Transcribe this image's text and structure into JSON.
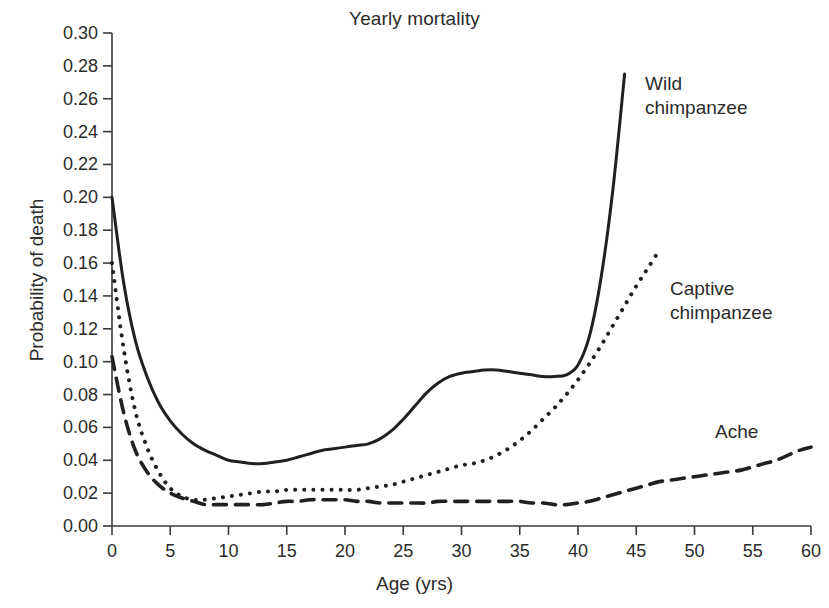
{
  "chart_data": {
    "type": "line",
    "title": "Yearly mortality",
    "xlabel": "Age (yrs)",
    "ylabel": "Probability of death",
    "xlim": [
      0,
      60
    ],
    "ylim": [
      0.0,
      0.3
    ],
    "grid": false,
    "legend_position": "inline-annotations",
    "xticks": [
      0,
      5,
      10,
      15,
      20,
      25,
      30,
      35,
      40,
      45,
      50,
      55,
      60
    ],
    "xtick_labels": [
      "0",
      "5",
      "10",
      "15",
      "20",
      "25",
      "30",
      "35",
      "40",
      "45",
      "50",
      "55",
      "60"
    ],
    "yticks": [
      0.0,
      0.02,
      0.04,
      0.06,
      0.08,
      0.1,
      0.12,
      0.14,
      0.16,
      0.18,
      0.2,
      0.22,
      0.24,
      0.26,
      0.28,
      0.3
    ],
    "ytick_labels": [
      "0.00",
      "0.02",
      "0.04",
      "0.06",
      "0.08",
      "0.10",
      "0.12",
      "0.14",
      "0.16",
      "0.18",
      "0.20",
      "0.22",
      "0.24",
      "0.26",
      "0.28",
      "0.30"
    ],
    "series": [
      {
        "name": "Wild chimpanzee",
        "style": "solid",
        "color": "#231f20",
        "x": [
          0,
          1,
          2,
          3,
          4,
          5,
          6,
          7,
          8,
          9,
          10,
          11,
          12,
          13,
          14,
          15,
          16,
          17,
          18,
          19,
          20,
          21,
          22,
          23,
          24,
          25,
          26,
          27,
          28,
          29,
          30,
          31,
          32,
          33,
          34,
          35,
          36,
          37,
          38,
          39,
          40,
          41,
          42,
          43,
          44
        ],
        "y": [
          0.2,
          0.148,
          0.113,
          0.091,
          0.075,
          0.064,
          0.056,
          0.05,
          0.046,
          0.043,
          0.04,
          0.039,
          0.038,
          0.038,
          0.039,
          0.04,
          0.042,
          0.044,
          0.046,
          0.047,
          0.048,
          0.049,
          0.05,
          0.053,
          0.058,
          0.065,
          0.073,
          0.081,
          0.087,
          0.091,
          0.093,
          0.094,
          0.095,
          0.095,
          0.094,
          0.093,
          0.092,
          0.091,
          0.091,
          0.092,
          0.098,
          0.116,
          0.152,
          0.205,
          0.275
        ]
      },
      {
        "name": "Captive chimpanzee",
        "style": "dotted",
        "color": "#231f20",
        "x": [
          0,
          1,
          2,
          3,
          4,
          5,
          6,
          7,
          8,
          9,
          10,
          11,
          12,
          13,
          14,
          15,
          16,
          17,
          18,
          19,
          20,
          21,
          22,
          23,
          24,
          25,
          26,
          27,
          28,
          29,
          30,
          31,
          32,
          33,
          34,
          35,
          36,
          37,
          38,
          39,
          40,
          41,
          42,
          43,
          44,
          45,
          46,
          47
        ],
        "y": [
          0.16,
          0.108,
          0.07,
          0.048,
          0.033,
          0.023,
          0.018,
          0.016,
          0.016,
          0.017,
          0.018,
          0.019,
          0.02,
          0.021,
          0.021,
          0.022,
          0.022,
          0.022,
          0.022,
          0.022,
          0.022,
          0.022,
          0.023,
          0.024,
          0.025,
          0.027,
          0.029,
          0.031,
          0.033,
          0.035,
          0.037,
          0.038,
          0.04,
          0.043,
          0.047,
          0.052,
          0.058,
          0.065,
          0.072,
          0.08,
          0.089,
          0.099,
          0.11,
          0.122,
          0.134,
          0.146,
          0.157,
          0.168
        ]
      },
      {
        "name": "Ache",
        "style": "dashed",
        "color": "#231f20",
        "x": [
          0,
          1,
          2,
          3,
          4,
          5,
          6,
          7,
          8,
          9,
          10,
          11,
          12,
          13,
          14,
          15,
          16,
          17,
          18,
          19,
          20,
          21,
          22,
          23,
          24,
          25,
          26,
          27,
          28,
          29,
          30,
          31,
          32,
          33,
          34,
          35,
          36,
          37,
          38,
          39,
          40,
          41,
          42,
          43,
          44,
          45,
          46,
          47,
          48,
          49,
          50,
          51,
          52,
          53,
          54,
          55,
          56,
          57,
          58,
          59,
          60
        ],
        "y": [
          0.103,
          0.069,
          0.046,
          0.033,
          0.025,
          0.02,
          0.017,
          0.015,
          0.013,
          0.013,
          0.013,
          0.013,
          0.013,
          0.013,
          0.014,
          0.015,
          0.015,
          0.016,
          0.016,
          0.016,
          0.016,
          0.015,
          0.015,
          0.014,
          0.014,
          0.014,
          0.014,
          0.014,
          0.015,
          0.015,
          0.015,
          0.015,
          0.015,
          0.015,
          0.015,
          0.015,
          0.014,
          0.014,
          0.013,
          0.013,
          0.014,
          0.015,
          0.017,
          0.019,
          0.021,
          0.023,
          0.025,
          0.027,
          0.028,
          0.029,
          0.03,
          0.031,
          0.032,
          0.033,
          0.034,
          0.036,
          0.038,
          0.04,
          0.043,
          0.046,
          0.048
        ]
      }
    ],
    "annotations": [
      {
        "text": "Wild\nchimpanzee",
        "series": "Wild chimpanzee"
      },
      {
        "text": "Captive\nchimpanzee",
        "series": "Captive chimpanzee"
      },
      {
        "text": "Ache",
        "series": "Ache"
      }
    ]
  },
  "axis_color": "#3a3a3a"
}
